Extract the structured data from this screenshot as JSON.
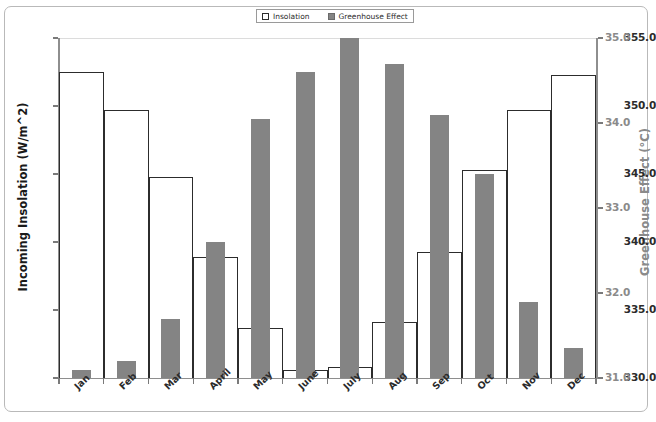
{
  "chart_data": {
    "type": "bar",
    "title": "",
    "categories": [
      "Jan",
      "Feb",
      "Mar",
      "April",
      "May",
      "June",
      "July",
      "Aug",
      "Sep",
      "Oct",
      "Nov",
      "Dec"
    ],
    "series": [
      {
        "name": "Insolation",
        "axis": "left",
        "style": "open-outline",
        "color": "#2c2c2c",
        "values": [
          352.5,
          349.7,
          344.8,
          338.9,
          333.7,
          330.6,
          330.8,
          334.1,
          339.3,
          345.3,
          349.7,
          352.3
        ]
      },
      {
        "name": "Greenhouse Effect",
        "axis": "right",
        "style": "filled",
        "color": "#848484",
        "values": [
          31.1,
          31.2,
          31.7,
          32.6,
          34.05,
          34.6,
          35.0,
          34.7,
          34.1,
          33.4,
          31.9,
          31.35
        ]
      }
    ],
    "xlabel": "",
    "ylabel": "Incoming Insolation (W/m^2)",
    "ylabel_right": "Greenhouse Effect (°C)",
    "ylim": [
      330.0,
      355.0
    ],
    "ylim_right": [
      31.0,
      35.0
    ],
    "yticks": [
      "330.0",
      "335.0",
      "340.0",
      "345.0",
      "350.0",
      "355.0"
    ],
    "yticks_right": [
      "31.0",
      "32.0",
      "33.0",
      "34.0",
      "35.0"
    ],
    "grid": false,
    "legend_position": "top-center"
  },
  "legend": {
    "items": [
      {
        "label": "Insolation",
        "swatch": "open-square-icon"
      },
      {
        "label": "Greenhouse Effect",
        "swatch": "filled-square-icon"
      }
    ]
  },
  "axes": {
    "left_title": "Incoming Insolation (W/m^2)",
    "right_title": "Greenhouse Effect (°C)"
  }
}
